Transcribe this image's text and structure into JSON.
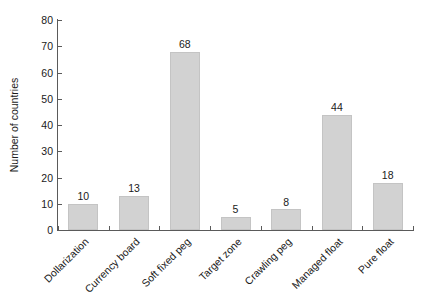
{
  "chart_data": {
    "type": "bar",
    "title": "",
    "subtitle": "",
    "xlabel": "",
    "ylabel": "Number of countries",
    "categories": [
      "Dollarization",
      "Currency board",
      "Soft fixed peg",
      "Target zone",
      "Crawling peg",
      "Managed float",
      "Pure float"
    ],
    "values": [
      10,
      13,
      68,
      5,
      8,
      44,
      18
    ],
    "ylim": [
      0,
      80
    ],
    "ytick_step": 10,
    "yticks": [
      0,
      10,
      20,
      30,
      40,
      50,
      60,
      70,
      80
    ],
    "ytick_labels": [
      "0",
      "10",
      "20",
      "30",
      "40",
      "50",
      "60",
      "70",
      "80"
    ],
    "value_labels": [
      "10",
      "13",
      "68",
      "5",
      "8",
      "44",
      "18"
    ],
    "grid": false,
    "legend": null,
    "legend_position": "none",
    "bar_color": "#d2d2d2",
    "bar_edge_color": "#c4c4c4",
    "axis_color": "#5a5a5a",
    "text_color": "#1a1a1a",
    "background_color": "#ffffff",
    "xtick_label_rotation": 45
  }
}
